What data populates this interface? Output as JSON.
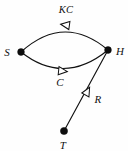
{
  "diagram": {
    "background_color": "#fefefe",
    "stroke_color": "#111111",
    "node_fill_color": "#0d0d0d",
    "arrowhead_style": "hollow-triangle",
    "nodes": [
      {
        "id": "S",
        "label": "S",
        "x": 21,
        "y": 52,
        "label_x": 7,
        "label_y": 52,
        "radius": 3.4
      },
      {
        "id": "H",
        "label": "H",
        "x": 108,
        "y": 50,
        "label_x": 120,
        "label_y": 51,
        "radius": 3.4
      },
      {
        "id": "T",
        "label": "T",
        "x": 64,
        "y": 131,
        "label_x": 63,
        "label_y": 145,
        "radius": 3.6
      }
    ],
    "edges": [
      {
        "id": "edge-kc",
        "from": "H",
        "to": "S",
        "label": "KC",
        "label_x": 66,
        "label_y": 10,
        "shape": "arc-upper",
        "path": "M 21 52 Q 64 13 108 50",
        "arrow_x": 66,
        "arrow_y": 25,
        "arrow_rotation": 188
      },
      {
        "id": "edge-c",
        "from": "S",
        "to": "H",
        "label": "C",
        "label_x": 60,
        "label_y": 82,
        "shape": "arc-lower",
        "path": "M 21 52 Q 64 86 108 50",
        "arrow_x": 62,
        "arrow_y": 71,
        "arrow_rotation": 6
      },
      {
        "id": "edge-r",
        "from": "T",
        "to": "H",
        "label": "R",
        "label_x": 98,
        "label_y": 99,
        "shape": "straight",
        "path": "M 64 131 L 108 50",
        "arrow_x": 87,
        "arrow_y": 92,
        "arrow_rotation": -61
      }
    ]
  }
}
